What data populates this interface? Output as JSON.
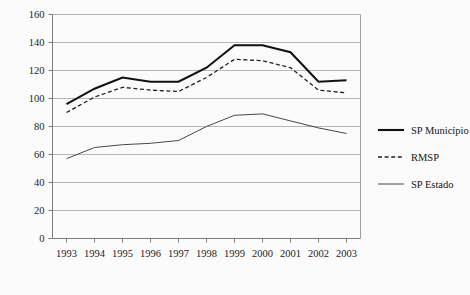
{
  "chart_data": {
    "type": "line",
    "title": "",
    "subtitle": "",
    "xlabel": "",
    "ylabel": "",
    "grid": true,
    "legend_position": "right",
    "categories": [
      "1993",
      "1994",
      "1995",
      "1996",
      "1997",
      "1998",
      "1999",
      "2000",
      "2001",
      "2002",
      "2003"
    ],
    "x": [
      1993,
      1994,
      1995,
      1996,
      1997,
      1998,
      1999,
      2000,
      2001,
      2002,
      2003
    ],
    "ylim": [
      0,
      160
    ],
    "yticks": [
      0,
      20,
      40,
      60,
      80,
      100,
      120,
      140,
      160
    ],
    "ytick_labels": [
      "0",
      "20",
      "40",
      "60",
      "80",
      "100",
      "120",
      "140",
      "160"
    ],
    "series": [
      {
        "name": "SP Município",
        "style": "solid-bold",
        "color": "#111111",
        "values": [
          96,
          107,
          115,
          112,
          112,
          122,
          138,
          138,
          133,
          112,
          113
        ]
      },
      {
        "name": "RMSP",
        "style": "dashed",
        "color": "#222222",
        "values": [
          90,
          101,
          108,
          106,
          105,
          115,
          128,
          127,
          122,
          106,
          104
        ]
      },
      {
        "name": "SP Estado",
        "style": "solid-thin",
        "color": "#333333",
        "values": [
          57,
          65,
          67,
          68,
          70,
          80,
          88,
          89,
          84,
          79,
          75
        ]
      }
    ]
  },
  "legend": {
    "items": [
      {
        "label": "SP Município",
        "style": "solid-bold"
      },
      {
        "label": "RMSP",
        "style": "dashed"
      },
      {
        "label": "SP Estado",
        "style": "solid-thin"
      }
    ]
  },
  "colors": {
    "background": "#fbfbfb",
    "gridline": "#9a9a9a",
    "axis": "#6d6d6d",
    "text": "#1a1a1a"
  }
}
